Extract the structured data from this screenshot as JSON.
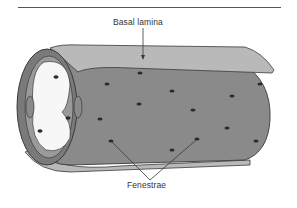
{
  "diagram": {
    "labels": {
      "basal_lamina": "Basal lamina",
      "fenestrae": "Fenestrae"
    },
    "colors": {
      "tube_fill": "#8a8a8a",
      "lamina_fill": "#b9b9b9",
      "lumen_fill": "#f7f7f7",
      "outline": "#3a3a3a",
      "fenestra": "#2a2a2a",
      "rule": "#555555"
    },
    "parts": [
      "endothelial tube",
      "basal lamina sheet",
      "lumen opening",
      "endothelial cell nuclei",
      "fenestrae (pores)"
    ]
  }
}
